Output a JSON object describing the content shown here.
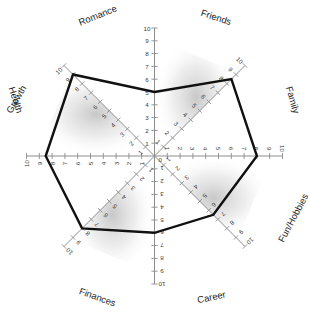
{
  "chart_data": {
    "type": "radar",
    "xlabel": "",
    "ylabel": "",
    "rlim": [
      0,
      10
    ],
    "grid": true,
    "legend": "none",
    "center_label": "0",
    "tick_values": [
      0,
      1,
      2,
      3,
      4,
      5,
      6,
      7,
      8,
      9,
      10
    ],
    "categories": [
      "Friends",
      "Family",
      "Fun/Hobbies",
      "Career",
      "Finances",
      "Health",
      "Growth",
      "Romance"
    ],
    "values": [
      5,
      8.5,
      8,
      6.5,
      6,
      8,
      8.5,
      9
    ],
    "axes": [
      {
        "label": "Friends",
        "angle_deg": 90,
        "value": 5,
        "tick_labels": [
          "1",
          "2",
          "3",
          "4",
          "5",
          "6",
          "7",
          "8",
          "9",
          "10"
        ]
      },
      {
        "label": "Family",
        "angle_deg": 45,
        "value": 8.5,
        "tick_labels": [
          "1",
          "2",
          "3",
          "4",
          "5",
          "6",
          "7",
          "8",
          "9",
          "10"
        ]
      },
      {
        "label": "Fun/Hobbies",
        "angle_deg": 0,
        "value": 8,
        "tick_labels": [
          "1",
          "2",
          "3",
          "4",
          "5",
          "6",
          "7",
          "8",
          "9",
          "10"
        ]
      },
      {
        "label": "Career",
        "angle_deg": -45,
        "value": 6.5,
        "tick_labels": [
          "1",
          "2",
          "3",
          "4",
          "5",
          "6",
          "7",
          "8",
          "9",
          "10"
        ]
      },
      {
        "label": "Career",
        "angle_deg": -90,
        "value": 6,
        "tick_labels": [
          "1",
          "2",
          "3",
          "4",
          "5",
          "6",
          "7",
          "8",
          "9",
          "10"
        ]
      },
      {
        "label": "Finances",
        "angle_deg": -135,
        "value": 8,
        "tick_labels": [
          "1",
          "2",
          "3",
          "4",
          "5",
          "6",
          "7",
          "8",
          "9",
          "10"
        ]
      },
      {
        "label": "Health",
        "angle_deg": 180,
        "value": 8.5,
        "tick_labels": [
          "1",
          "2",
          "3",
          "4",
          "5",
          "6",
          "7",
          "8",
          "9",
          "10"
        ]
      },
      {
        "label": "Growth",
        "angle_deg": 135,
        "value": 9,
        "tick_labels": [
          "1",
          "2",
          "3",
          "4",
          "5",
          "6",
          "7",
          "8",
          "9",
          "10"
        ]
      }
    ],
    "outer_labels": [
      {
        "name": "Romance",
        "rotate_deg": -22
      },
      {
        "name": "Friends",
        "rotate_deg": 18
      },
      {
        "name": "Family",
        "rotate_deg": 74
      },
      {
        "name": "Fun/Hobbies",
        "rotate_deg": -62
      },
      {
        "name": "Career",
        "rotate_deg": -12
      },
      {
        "name": "Finances",
        "rotate_deg": 20
      },
      {
        "name": "Health",
        "rotate_deg": 72
      },
      {
        "name": "Growth",
        "rotate_deg": -60
      }
    ]
  },
  "colors": {
    "data_stroke": "#111111",
    "axis": "#8d8d8d",
    "text": "#1d1d1d",
    "shade": "#b9b9b9",
    "background": "#ffffff"
  }
}
